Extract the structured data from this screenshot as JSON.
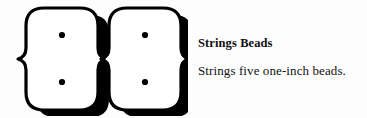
{
  "page": {
    "background_color": "#fdfdfd",
    "text_color": "#111111"
  },
  "illustration": {
    "name": "two-beads-figure-eight",
    "description_alt": "Two large figure-eight shaped beads drawn in white with black outline and heavy black drop shadow, each bead showing two small round holes",
    "bead_count": 2,
    "holes_per_bead": 2,
    "fill_color": "#ffffff",
    "outline_color": "#000000",
    "shadow_color": "#000000"
  },
  "caption": {
    "title": "Strings Beads",
    "description": "Strings five one-inch beads."
  }
}
